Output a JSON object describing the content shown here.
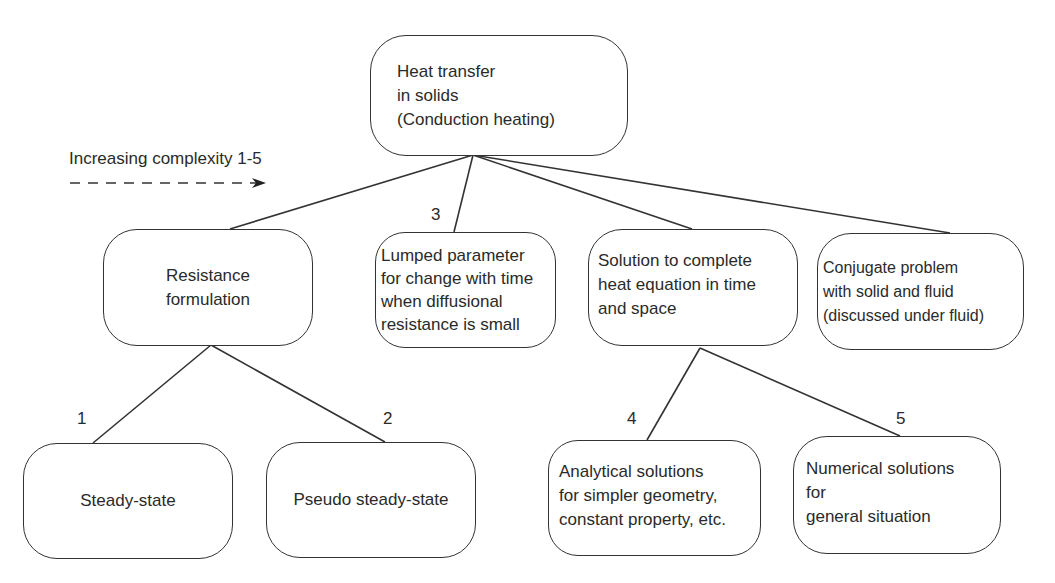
{
  "diagram": {
    "legend": {
      "caption": "Increasing complexity 1-5",
      "arrow": "dashed-arrow-right"
    },
    "root": {
      "lines": [
        "Heat transfer",
        "in solids",
        "(Conduction heating)"
      ]
    },
    "level1": [
      {
        "id": "resistance",
        "lines": [
          "Resistance",
          "formulation"
        ]
      },
      {
        "id": "lumped",
        "step": "3",
        "lines": [
          "Lumped parameter",
          "for change with time",
          "when diffusional",
          "resistance is small"
        ]
      },
      {
        "id": "solution",
        "lines": [
          "Solution to complete",
          "heat equation in time",
          "and space"
        ]
      },
      {
        "id": "conjugate",
        "lines": [
          "Conjugate problem",
          "with solid and fluid",
          "(discussed under fluid)"
        ]
      }
    ],
    "level2": [
      {
        "id": "steady",
        "parent": "resistance",
        "step": "1",
        "lines": [
          "Steady-state"
        ]
      },
      {
        "id": "pseudo",
        "parent": "resistance",
        "step": "2",
        "lines": [
          "Pseudo steady-state"
        ]
      },
      {
        "id": "analytical",
        "parent": "solution",
        "step": "4",
        "lines": [
          "Analytical solutions",
          "for simpler geometry,",
          "constant property, etc."
        ]
      },
      {
        "id": "numerical",
        "parent": "solution",
        "step": "5",
        "lines": [
          "Numerical solutions",
          "for",
          "general situation"
        ]
      }
    ],
    "colors": {
      "line": "#333333",
      "text": "#2a2a2a",
      "background": "#ffffff"
    }
  }
}
